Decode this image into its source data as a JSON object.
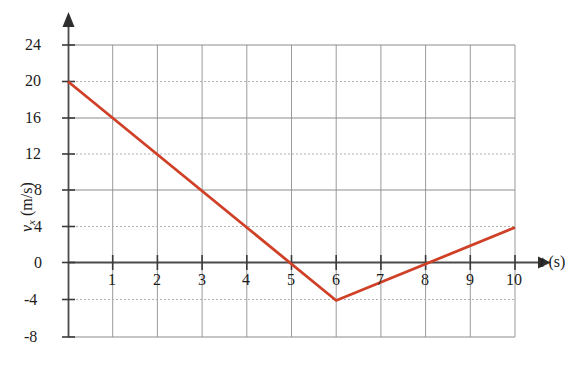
{
  "chart_data": {
    "type": "line",
    "title": "",
    "xlabel": "t (s)",
    "ylabel": "v_x (m/s)",
    "ylabel_main": "v",
    "ylabel_sub": "x",
    "ylabel_units": "(m/s)",
    "xlabel_main": "t",
    "xlabel_units": "(s)",
    "xlim": [
      0,
      10
    ],
    "ylim": [
      -8,
      24
    ],
    "xticks": [
      1,
      2,
      3,
      4,
      5,
      6,
      7,
      8,
      9,
      10
    ],
    "xtick_labels": [
      "1",
      "2",
      "3",
      "4",
      "5",
      "6",
      "7",
      "8",
      "9",
      "10"
    ],
    "yticks": [
      -8,
      -4,
      0,
      4,
      8,
      12,
      16,
      20,
      24
    ],
    "ytick_labels": [
      "-8",
      "-4",
      "0",
      "4",
      "8",
      "12",
      "16",
      "20",
      "24"
    ],
    "grid": true,
    "grid_major_values_y": [
      -8,
      0,
      8,
      16,
      24
    ],
    "grid_minor_values_y": [
      -4,
      4,
      12,
      20
    ],
    "legend": null,
    "series": [
      {
        "name": "v_x",
        "color": "#cf4027",
        "x": [
          0,
          6,
          10
        ],
        "values": [
          20,
          -4,
          4
        ],
        "points": [
          {
            "x": 0,
            "y": 20
          },
          {
            "x": 1,
            "y": 16
          },
          {
            "x": 2,
            "y": 12
          },
          {
            "x": 3,
            "y": 8
          },
          {
            "x": 4,
            "y": 4
          },
          {
            "x": 5,
            "y": 0
          },
          {
            "x": 6,
            "y": -4
          },
          {
            "x": 7,
            "y": -2
          },
          {
            "x": 8,
            "y": 0
          },
          {
            "x": 9,
            "y": 2
          },
          {
            "x": 10,
            "y": 4
          }
        ]
      }
    ],
    "colors": {
      "curve": "#cf4027",
      "axis": "#4a4a4a",
      "grid_major": "#8c8c8c",
      "grid_minor": "#b4b4b4",
      "text": "#1c1c1c",
      "background": "#ffffff"
    }
  }
}
